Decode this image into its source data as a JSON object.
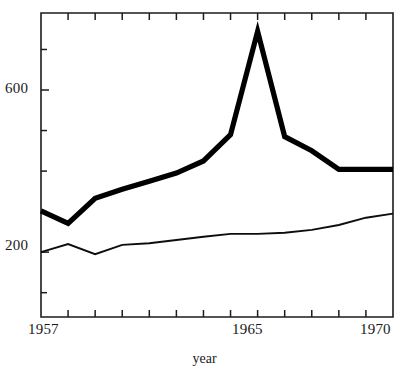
{
  "chart_data": {
    "type": "line",
    "title": "",
    "subtitle": "",
    "xlabel": "year",
    "ylabel": "",
    "x": [
      1957,
      1958,
      1959,
      1960,
      1961,
      1962,
      1963,
      1964,
      1965,
      1966,
      1967,
      1968,
      1969,
      1970
    ],
    "xlim": [
      1957,
      1970
    ],
    "ylim": [
      40,
      790
    ],
    "grid": false,
    "legend": "none",
    "x_tick_labels": [
      "1957",
      "1965",
      "1970"
    ],
    "x_tick_label_values": [
      1957,
      1965,
      1970
    ],
    "x_minor_ticks": [
      1958,
      1959,
      1960,
      1961,
      1962,
      1963,
      1964,
      1965,
      1966,
      1967,
      1968,
      1969
    ],
    "y_tick_labels": [
      "200",
      "600"
    ],
    "y_tick_label_values": [
      200,
      600
    ],
    "y_minor_ticks": [
      100,
      300,
      400,
      500,
      700
    ],
    "series": [
      {
        "name": "thick-series",
        "style": "thick",
        "color": "#000000",
        "values": [
          302,
          271,
          333,
          355,
          375,
          395,
          425,
          490,
          745,
          485,
          450,
          404,
          404,
          404
        ]
      },
      {
        "name": "thin-series",
        "style": "thin",
        "color": "#0d0d0d",
        "values": [
          200,
          220,
          195,
          218,
          222,
          230,
          238,
          245,
          245,
          248,
          255,
          267,
          285,
          295
        ]
      }
    ]
  },
  "axis": {
    "x_title": "year",
    "y_tick_600": "600",
    "y_tick_200": "200",
    "x_tick_start": "1957",
    "x_tick_mid": "1965",
    "x_tick_end": "1970"
  },
  "colors": {
    "axis": "#1c1c1c",
    "thick_series": "#000000",
    "thin_series": "#0d0d0d",
    "background": "#ffffff"
  }
}
